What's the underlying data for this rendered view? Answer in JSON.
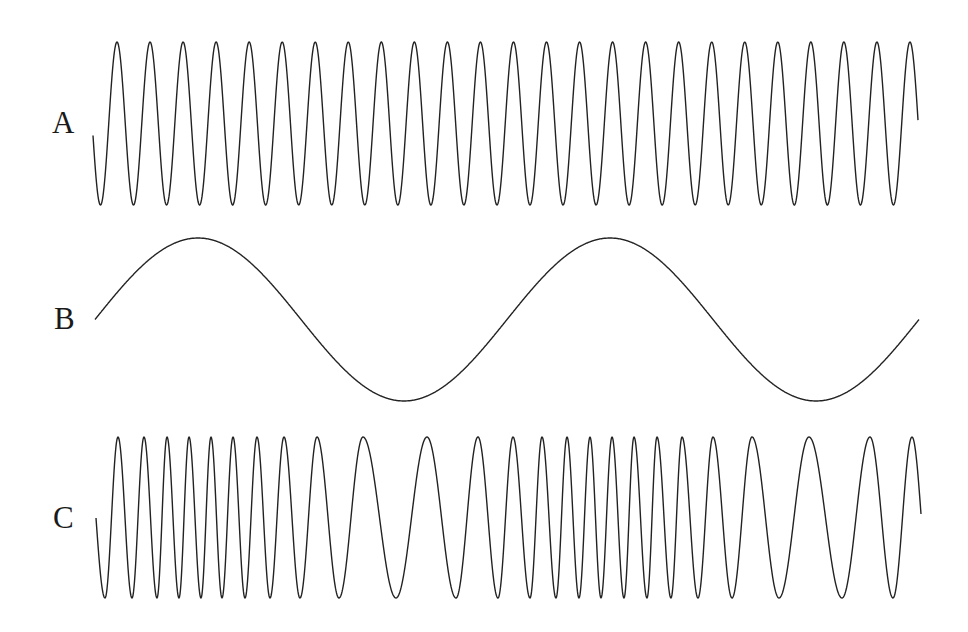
{
  "labels": {
    "a": "A",
    "b": "B",
    "c": "C"
  },
  "chart_data": {
    "type": "line",
    "title": "",
    "xlabel": "",
    "ylabel": "",
    "grid": false,
    "series": [
      {
        "name": "A",
        "description": "constant-frequency sine (carrier), 25 cycles",
        "x_start": 93,
        "x_end": 918,
        "midline_y": 123.5,
        "amplitude": 81.5,
        "period_px": 33.04,
        "first_peak_x": 117
      },
      {
        "name": "B",
        "description": "low-frequency sine (modulating signal), 2 cycles",
        "x_start": 95,
        "x_end": 919,
        "midline_y": 319.5,
        "amplitude": 81.5,
        "period_px": 412,
        "first_peak_x": 198
      },
      {
        "name": "C",
        "description": "frequency-modulated wave",
        "x_start": 96,
        "x_end": 921,
        "start_y": 518,
        "end_y": 514,
        "midline_y": 517.5,
        "amplitude": 80.5,
        "extrema": [
          [
            105,
            -1
          ],
          [
            118,
            1
          ],
          [
            132,
            -1
          ],
          [
            144,
            1
          ],
          [
            157,
            -1
          ],
          [
            167,
            1
          ],
          [
            179,
            -1
          ],
          [
            189,
            1
          ],
          [
            201,
            -1
          ],
          [
            211,
            1
          ],
          [
            222,
            -1
          ],
          [
            233,
            1
          ],
          [
            245,
            -1
          ],
          [
            257,
            1
          ],
          [
            270,
            -1
          ],
          [
            284,
            1
          ],
          [
            300,
            -1
          ],
          [
            317,
            1
          ],
          [
            339,
            -1
          ],
          [
            363,
            1
          ],
          [
            396,
            -1
          ],
          [
            427,
            1
          ],
          [
            456,
            -1
          ],
          [
            478,
            1
          ],
          [
            498,
            -1
          ],
          [
            513,
            1
          ],
          [
            530,
            -1
          ],
          [
            542,
            1
          ],
          [
            556,
            -1
          ],
          [
            567,
            1
          ],
          [
            579,
            -1
          ],
          [
            590,
            1
          ],
          [
            601,
            -1
          ],
          [
            612,
            1
          ],
          [
            624,
            -1
          ],
          [
            634,
            1
          ],
          [
            647,
            -1
          ],
          [
            657,
            1
          ],
          [
            671,
            -1
          ],
          [
            682,
            1
          ],
          [
            698,
            -1
          ],
          [
            713,
            1
          ],
          [
            732,
            -1
          ],
          [
            752,
            1
          ],
          [
            779,
            -1
          ],
          [
            809,
            1
          ],
          [
            842,
            -1
          ],
          [
            870,
            1
          ],
          [
            893,
            -1
          ],
          [
            912,
            1
          ]
        ]
      }
    ]
  }
}
